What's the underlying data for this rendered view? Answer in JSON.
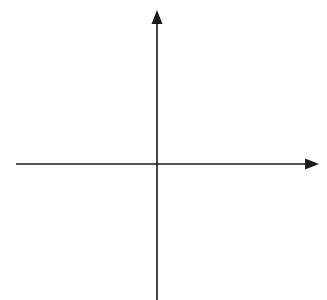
{
  "diagram": {
    "type": "cartesian-coordinate-grid",
    "axes": {
      "x_label": "x",
      "y_label": "y",
      "x_range": [
        -5,
        5
      ],
      "y_range": [
        -5,
        5
      ]
    },
    "x_ticks": [
      {
        "value": -5,
        "label": "−5"
      },
      {
        "value": -4,
        "label": "−4"
      },
      {
        "value": -3,
        "label": "−3"
      },
      {
        "value": -2,
        "label": "−2"
      },
      {
        "value": -1,
        "label": "−1"
      },
      {
        "value": 1,
        "label": "1"
      },
      {
        "value": 2,
        "label": "2"
      },
      {
        "value": 3,
        "label": "3"
      },
      {
        "value": 4,
        "label": "4"
      },
      {
        "value": 5,
        "label": "5"
      }
    ],
    "y_ticks": [
      {
        "value": 5,
        "label": "5"
      },
      {
        "value": 4,
        "label": "4"
      },
      {
        "value": 3,
        "label": "3"
      },
      {
        "value": 2,
        "label": "2"
      },
      {
        "value": 1,
        "label": "1"
      },
      {
        "value": -1,
        "label": "−1"
      },
      {
        "value": -2,
        "label": "−2"
      },
      {
        "value": -3,
        "label": "−3"
      },
      {
        "value": -4,
        "label": "−4"
      },
      {
        "value": -5,
        "label": "−5"
      }
    ],
    "grid": {
      "style": "dotted",
      "color": "#bdbdbd"
    },
    "axis_color": "#1a1a1a"
  }
}
